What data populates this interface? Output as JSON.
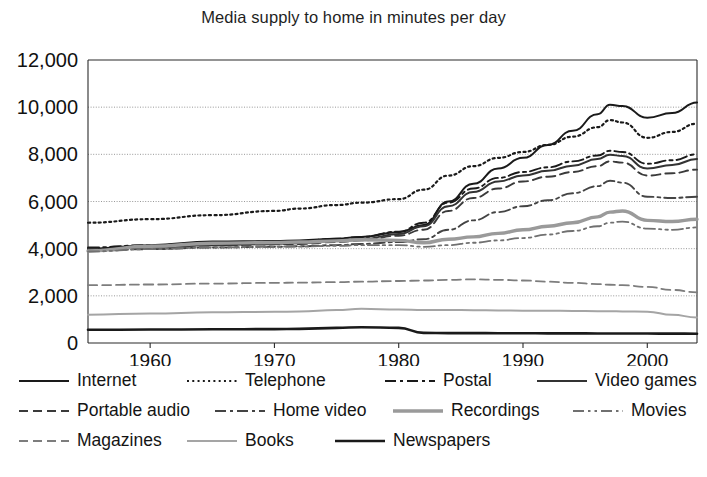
{
  "chart_data": {
    "type": "line",
    "title": "Media supply to home in minutes per day",
    "xlabel": "",
    "ylabel": "",
    "xlim": [
      1955,
      2004
    ],
    "ylim": [
      0,
      12000
    ],
    "grid": true,
    "legend_position": "bottom",
    "ytick_labels": [
      "12,000",
      "10,000",
      "8,000",
      "6,000",
      "4,000",
      "2,000",
      "0"
    ],
    "ytick_values": [
      12000,
      10000,
      8000,
      6000,
      4000,
      2000,
      0
    ],
    "xtick_labels": [
      "1960",
      "1970",
      "1980",
      "1990",
      "2000"
    ],
    "xtick_values": [
      1960,
      1970,
      1980,
      1990,
      2000
    ],
    "x": [
      1955,
      1960,
      1965,
      1970,
      1972,
      1975,
      1977,
      1980,
      1982,
      1984,
      1986,
      1988,
      1990,
      1992,
      1994,
      1996,
      1997,
      1998,
      2000,
      2002,
      2004
    ],
    "series": [
      {
        "name": "Internet",
        "style": "solid",
        "color": "#1a1a1a",
        "width": 2.0,
        "values": [
          4000,
          4150,
          4300,
          4320,
          4350,
          4420,
          4500,
          4700,
          5000,
          6000,
          6750,
          7400,
          7850,
          8400,
          9000,
          9700,
          10100,
          10050,
          9550,
          9750,
          10200
        ]
      },
      {
        "name": "Telephone",
        "style": "dotted",
        "color": "#1a1a1a",
        "width": 2.2,
        "values": [
          5100,
          5250,
          5420,
          5600,
          5700,
          5850,
          5950,
          6100,
          6500,
          7100,
          7500,
          7850,
          8100,
          8400,
          8750,
          9150,
          9450,
          9350,
          8700,
          8950,
          9300
        ]
      },
      {
        "name": "Postal",
        "style": "dashdot",
        "color": "#1a1a1a",
        "width": 1.9,
        "values": [
          4050,
          4150,
          4250,
          4300,
          4330,
          4420,
          4500,
          4720,
          5100,
          5950,
          6550,
          7000,
          7250,
          7450,
          7700,
          7950,
          8150,
          8100,
          7600,
          7750,
          8000
        ]
      },
      {
        "name": "Video games",
        "style": "solid",
        "color": "#333333",
        "width": 2.0,
        "values": [
          3950,
          4050,
          4150,
          4200,
          4230,
          4320,
          4400,
          4620,
          4950,
          5800,
          6400,
          6850,
          7100,
          7300,
          7520,
          7800,
          7980,
          7930,
          7400,
          7550,
          7800
        ]
      },
      {
        "name": "Portable audio",
        "style": "dashed",
        "color": "#3a3a3a",
        "width": 1.9,
        "values": [
          3980,
          4060,
          4140,
          4180,
          4200,
          4280,
          4350,
          4550,
          4800,
          5600,
          6150,
          6550,
          6850,
          7050,
          7250,
          7500,
          7700,
          7650,
          7100,
          7200,
          7350
        ]
      },
      {
        "name": "Home video",
        "style": "dashdot",
        "color": "#444444",
        "width": 1.9,
        "values": [
          3900,
          3980,
          4050,
          4080,
          4100,
          4150,
          4200,
          4280,
          4400,
          4800,
          5200,
          5550,
          5800,
          6050,
          6350,
          6650,
          6880,
          6800,
          6200,
          6150,
          6200
        ]
      },
      {
        "name": "Recordings",
        "style": "solid",
        "color": "#9a9a9a",
        "width": 3.4,
        "values": [
          3900,
          4100,
          4230,
          4260,
          4280,
          4330,
          4380,
          4350,
          4250,
          4400,
          4500,
          4650,
          4800,
          4950,
          5100,
          5350,
          5550,
          5600,
          5200,
          5150,
          5250
        ]
      },
      {
        "name": "Movies",
        "style": "dashdotdot",
        "color": "#707070",
        "width": 1.8,
        "values": [
          3880,
          3980,
          4050,
          4080,
          4090,
          4120,
          4150,
          4150,
          4080,
          4150,
          4250,
          4350,
          4450,
          4600,
          4750,
          4950,
          5100,
          5150,
          4850,
          4800,
          4900
        ]
      },
      {
        "name": "Magazines",
        "style": "dashed",
        "color": "#7d7d7d",
        "width": 1.8,
        "values": [
          2450,
          2480,
          2520,
          2550,
          2560,
          2580,
          2600,
          2630,
          2650,
          2680,
          2700,
          2680,
          2650,
          2600,
          2550,
          2500,
          2470,
          2450,
          2380,
          2250,
          2150
        ]
      },
      {
        "name": "Books",
        "style": "solid",
        "color": "#a5a5a5",
        "width": 2.0,
        "values": [
          1200,
          1250,
          1300,
          1320,
          1340,
          1400,
          1450,
          1420,
          1400,
          1400,
          1390,
          1380,
          1370,
          1370,
          1360,
          1350,
          1350,
          1340,
          1330,
          1200,
          1080
        ]
      },
      {
        "name": "Newspapers",
        "style": "solid",
        "color": "#1a1a1a",
        "width": 2.6,
        "values": [
          560,
          570,
          580,
          590,
          600,
          640,
          670,
          640,
          430,
          420,
          420,
          415,
          412,
          410,
          408,
          405,
          403,
          402,
          400,
          398,
          395
        ]
      }
    ]
  },
  "legend": {
    "rows": [
      [
        {
          "label": "Internet",
          "style": "solid",
          "color": "#1a1a1a",
          "width": 2.0
        },
        {
          "label": "Telephone",
          "style": "dotted",
          "color": "#1a1a1a",
          "width": 2.2
        },
        {
          "label": "Postal",
          "style": "dashdot",
          "color": "#1a1a1a",
          "width": 1.9
        },
        {
          "label": "Video games",
          "style": "solid",
          "color": "#333333",
          "width": 2.0
        }
      ],
      [
        {
          "label": "Portable audio",
          "style": "dashed",
          "color": "#3a3a3a",
          "width": 1.9
        },
        {
          "label": "Home video",
          "style": "dashdot",
          "color": "#444444",
          "width": 1.9
        },
        {
          "label": "Recordings",
          "style": "solid",
          "color": "#9a9a9a",
          "width": 3.4
        },
        {
          "label": "Movies",
          "style": "dashdotdot",
          "color": "#707070",
          "width": 1.8
        }
      ],
      [
        {
          "label": "Magazines",
          "style": "dashed",
          "color": "#7d7d7d",
          "width": 1.8
        },
        {
          "label": "Books",
          "style": "solid",
          "color": "#a5a5a5",
          "width": 2.0
        },
        {
          "label": "Newspapers",
          "style": "solid",
          "color": "#1a1a1a",
          "width": 2.6
        }
      ]
    ]
  }
}
